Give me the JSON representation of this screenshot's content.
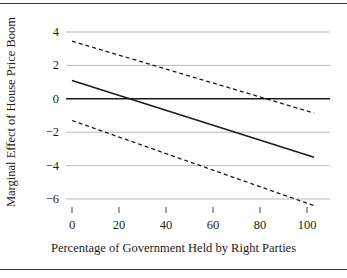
{
  "chart_data": {
    "type": "line",
    "title": "",
    "xlabel": "Percentage of Government Held by Right Parties",
    "ylabel": "Marginal Effect of House Price Boom",
    "xlim": [
      -4,
      107
    ],
    "ylim": [
      -7.1,
      4.9
    ],
    "xticks": [
      0,
      20,
      40,
      60,
      80,
      100
    ],
    "xtick_labels": [
      "0",
      "20",
      "40",
      "60",
      "80",
      "100"
    ],
    "yticks": [
      4,
      2,
      0,
      -2,
      -4,
      -6
    ],
    "ytick_labels": [
      "4",
      "2",
      "0",
      "−2",
      "−4",
      "−6"
    ],
    "grid": true,
    "grid_color": "#b9b9b9",
    "zero_line": true,
    "zero_line_color": "#1a1a1a",
    "legend": "none",
    "series": [
      {
        "name": "Marginal effect",
        "style": "solid",
        "color": "#1a1a1a",
        "x": [
          0,
          103
        ],
        "values": [
          1.1,
          -3.5
        ]
      },
      {
        "name": "Upper 95% confidence bound",
        "style": "dashed",
        "color": "#1a1a1a",
        "x": [
          0,
          103
        ],
        "values": [
          3.45,
          -0.85
        ]
      },
      {
        "name": "Lower 95% confidence bound",
        "style": "dashed",
        "color": "#1a1a1a",
        "x": [
          0,
          103
        ],
        "values": [
          -1.3,
          -6.4
        ]
      }
    ]
  },
  "figure": {
    "border_color": "#3a3a3a",
    "background": "#ffffff"
  }
}
